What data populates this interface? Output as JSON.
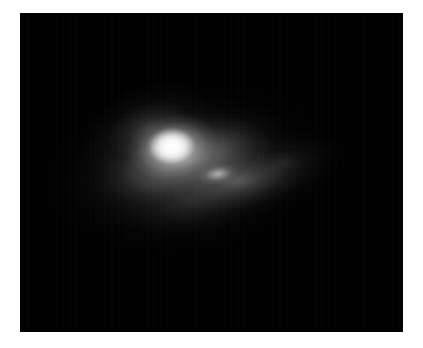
{
  "figure": {
    "background_color": "#ffffff",
    "panel_background_color": "#000000",
    "colormap": "grayscale",
    "caption": "",
    "alt_text": "Grayscale astronomical image of a diffuse elongated nebulous source with a bright compact nucleus and a fainter secondary knot"
  },
  "panel": {
    "left_px": 20,
    "top_px": 13,
    "width_px": 383,
    "height_px": 319
  },
  "features": [
    {
      "id": "core-nucleus",
      "label": "bright compact nucleus",
      "center_px": [
        172,
        147
      ],
      "peak_gray_level": 255,
      "approx_size_px": [
        52,
        40
      ]
    },
    {
      "id": "core-envelope",
      "label": "inner bright envelope",
      "center_px": [
        172,
        147
      ],
      "peak_gray_level": 236,
      "approx_size_px": [
        104,
        72
      ]
    },
    {
      "id": "secondary-knot",
      "label": "secondary knot",
      "center_px": [
        218,
        174
      ],
      "peak_gray_level": 214,
      "approx_size_px": [
        42,
        22
      ]
    },
    {
      "id": "halo-mid",
      "label": "mid halo bar",
      "center_px": [
        188,
        161
      ],
      "peak_gray_level": 196,
      "approx_size_px": [
        208,
        92
      ],
      "position_angle_deg": -14
    },
    {
      "id": "halo-plume",
      "label": "south-east plume",
      "center_px": [
        238,
        181
      ],
      "peak_gray_level": 168,
      "approx_size_px": [
        192,
        80
      ],
      "position_angle_deg": -10
    },
    {
      "id": "halo-nw",
      "label": "north-west extension",
      "center_px": [
        148,
        129
      ],
      "peak_gray_level": 140,
      "approx_size_px": [
        140,
        88
      ],
      "position_angle_deg": -20
    },
    {
      "id": "halo-south",
      "label": "southern faint envelope",
      "center_px": [
        192,
        201
      ],
      "peak_gray_level": 104,
      "approx_size_px": [
        220,
        104
      ],
      "position_angle_deg": -8
    },
    {
      "id": "halo-outer",
      "label": "broad outer halo",
      "center_px": [
        180,
        163
      ],
      "peak_gray_level": 150,
      "approx_size_px": [
        300,
        156
      ],
      "position_angle_deg": -13
    },
    {
      "id": "wisp-ne",
      "label": "faint north-east wisp",
      "center_px": [
        282,
        163
      ],
      "peak_gray_level": 96,
      "approx_size_px": [
        124,
        60
      ],
      "position_angle_deg": -12
    }
  ]
}
